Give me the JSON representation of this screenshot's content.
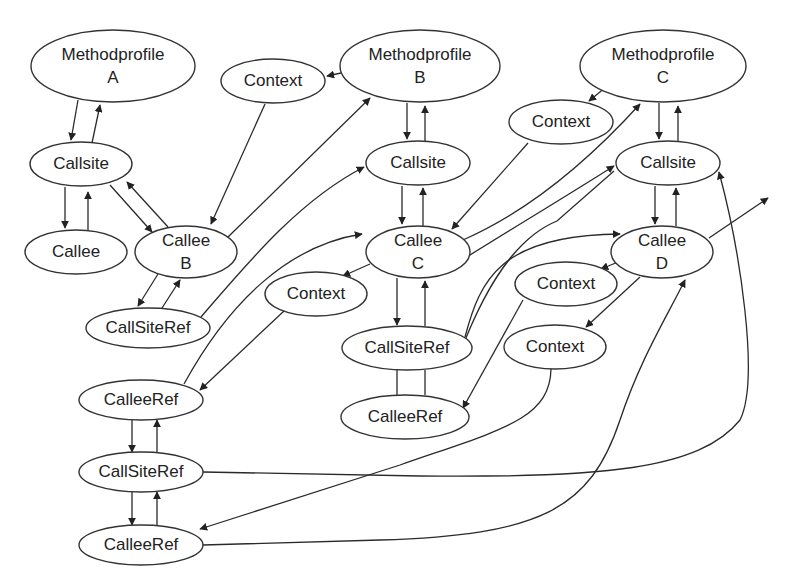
{
  "diagram": {
    "type": "graph",
    "colors": {
      "stroke": "#333333",
      "text": "#222222",
      "background": "#ffffff"
    },
    "nodes": [
      {
        "id": "mpA",
        "label": "Methodprofile",
        "sublabel": "A",
        "cx": 113,
        "cy": 66,
        "rx": 82,
        "ry": 36
      },
      {
        "id": "ctxTop",
        "label": "Context",
        "sublabel": "",
        "cx": 273,
        "cy": 81,
        "rx": 52,
        "ry": 22
      },
      {
        "id": "mpB",
        "label": "Methodprofile",
        "sublabel": "B",
        "cx": 420,
        "cy": 66,
        "rx": 80,
        "ry": 36
      },
      {
        "id": "mpC",
        "label": "Methodprofile",
        "sublabel": "C",
        "cx": 663,
        "cy": 66,
        "rx": 83,
        "ry": 36
      },
      {
        "id": "ctxC",
        "label": "Context",
        "sublabel": "",
        "cx": 561,
        "cy": 122,
        "rx": 52,
        "ry": 22
      },
      {
        "id": "csA",
        "label": "Callsite",
        "sublabel": "",
        "cx": 81,
        "cy": 164,
        "rx": 51,
        "ry": 22
      },
      {
        "id": "csB",
        "label": "Callsite",
        "sublabel": "",
        "cx": 418,
        "cy": 163,
        "rx": 52,
        "ry": 22
      },
      {
        "id": "csC",
        "label": "Callsite",
        "sublabel": "",
        "cx": 668,
        "cy": 163,
        "rx": 52,
        "ry": 22
      },
      {
        "id": "calleeA",
        "label": "Callee",
        "sublabel": "",
        "cx": 76,
        "cy": 252,
        "rx": 51,
        "ry": 22
      },
      {
        "id": "calleeB",
        "label": "Callee",
        "sublabel": "B",
        "cx": 186,
        "cy": 252,
        "rx": 51,
        "ry": 26
      },
      {
        "id": "calleeC",
        "label": "Callee",
        "sublabel": "C",
        "cx": 418,
        "cy": 252,
        "rx": 52,
        "ry": 26
      },
      {
        "id": "calleeD",
        "label": "Callee",
        "sublabel": "D",
        "cx": 662,
        "cy": 252,
        "rx": 51,
        "ry": 26
      },
      {
        "id": "ctxMid",
        "label": "Context",
        "sublabel": "",
        "cx": 316,
        "cy": 294,
        "rx": 51,
        "ry": 22
      },
      {
        "id": "ctxD1",
        "label": "Context",
        "sublabel": "",
        "cx": 566,
        "cy": 284,
        "rx": 51,
        "ry": 22
      },
      {
        "id": "ctxD2",
        "label": "Context",
        "sublabel": "",
        "cx": 555,
        "cy": 347,
        "rx": 51,
        "ry": 22
      },
      {
        "id": "csr1",
        "label": "CallSiteRef",
        "sublabel": "",
        "cx": 148,
        "cy": 328,
        "rx": 62,
        "ry": 20
      },
      {
        "id": "csrC",
        "label": "CallSiteRef",
        "sublabel": "",
        "cx": 407,
        "cy": 348,
        "rx": 65,
        "ry": 22
      },
      {
        "id": "cer1",
        "label": "CalleeRef",
        "sublabel": "",
        "cx": 141,
        "cy": 400,
        "rx": 62,
        "ry": 20
      },
      {
        "id": "cerC",
        "label": "CalleeRef",
        "sublabel": "",
        "cx": 405,
        "cy": 417,
        "rx": 64,
        "ry": 22
      },
      {
        "id": "csr2",
        "label": "CallSiteRef",
        "sublabel": "",
        "cx": 141,
        "cy": 472,
        "rx": 62,
        "ry": 20
      },
      {
        "id": "cer2",
        "label": "CalleeRef",
        "sublabel": "",
        "cx": 141,
        "cy": 545,
        "rx": 62,
        "ry": 20
      }
    ],
    "edges": [
      {
        "from": "mpA",
        "to": "csA",
        "d": "M78,100 L71,140",
        "arrow": true
      },
      {
        "from": "csA",
        "to": "mpA",
        "d": "M92,143 L100,105",
        "arrow": true
      },
      {
        "from": "mpB",
        "to": "ctxTop",
        "d": "M341,73 L327,76",
        "arrow": true
      },
      {
        "from": "ctxTop",
        "to": "calleeB",
        "d": "M265,104 L211,224",
        "arrow": true
      },
      {
        "from": "calleeB",
        "to": "mpB",
        "d": "M228,237 L370,98",
        "arrow": true
      },
      {
        "from": "mpB",
        "to": "csB",
        "d": "M407,103 L407,139",
        "arrow": true
      },
      {
        "from": "csB",
        "to": "mpB",
        "d": "M425,141 L425,106",
        "arrow": true
      },
      {
        "from": "csA",
        "to": "calleeA",
        "d": "M65,187 L65,228",
        "arrow": true
      },
      {
        "from": "calleeA",
        "to": "csA",
        "d": "M88,230 L88,192",
        "arrow": true
      },
      {
        "from": "csA",
        "to": "calleeB",
        "d": "M110,185 L152,232",
        "arrow": true
      },
      {
        "from": "calleeB",
        "to": "csA",
        "d": "M168,227 L127,182",
        "arrow": true
      },
      {
        "from": "csB",
        "to": "calleeC",
        "d": "M402,186 L402,224",
        "arrow": true
      },
      {
        "from": "calleeC",
        "to": "csB",
        "d": "M423,226 L423,188",
        "arrow": true
      },
      {
        "from": "mpC",
        "to": "ctxC",
        "d": "M606,87 L589,101",
        "arrow": true
      },
      {
        "from": "ctxC",
        "to": "calleeC",
        "d": "M528,143 L452,229",
        "arrow": true
      },
      {
        "from": "calleeC",
        "to": "mpC",
        "d": "M463,240 C520,215 580,170 640,104",
        "arrow": true
      },
      {
        "from": "mpC",
        "to": "csC",
        "d": "M659,103 L659,139",
        "arrow": true
      },
      {
        "from": "csC",
        "to": "mpC",
        "d": "M678,141 L678,106",
        "arrow": true
      },
      {
        "from": "csC",
        "to": "calleeD",
        "d": "M655,186 L655,224",
        "arrow": true
      },
      {
        "from": "calleeD",
        "to": "csC",
        "d": "M676,226 L676,188",
        "arrow": true
      },
      {
        "from": "calleeD",
        "to": "out",
        "d": "M709,238 L768,198",
        "arrow": true
      },
      {
        "from": "calleeB",
        "to": "csr1",
        "d": "M158,274 L138,306",
        "arrow": true
      },
      {
        "from": "csr1",
        "to": "calleeB",
        "d": "M162,308 L180,280",
        "arrow": true
      },
      {
        "from": "csr1",
        "to": "csB",
        "d": "M201,317 C250,260 300,200 364,167",
        "arrow": true
      },
      {
        "from": "cer1",
        "to": "calleeC",
        "d": "M184,384 C230,300 290,245 362,234",
        "arrow": true
      },
      {
        "from": "calleeC",
        "to": "ctxMid",
        "d": "M370,264 L343,276",
        "arrow": true
      },
      {
        "from": "ctxMid",
        "to": "cer1",
        "d": "M284,311 L200,390",
        "arrow": true
      },
      {
        "from": "calleeC",
        "to": "csrC",
        "d": "M397,278 L397,325",
        "arrow": true
      },
      {
        "from": "csrC",
        "to": "calleeC",
        "d": "M425,326 L425,281",
        "arrow": true
      },
      {
        "from": "csrC",
        "to": "cerC",
        "d": "M397,370 L397,395",
        "arrow": false
      },
      {
        "from": "cerC",
        "to": "csrC",
        "d": "M425,395 L425,370",
        "arrow": false
      },
      {
        "from": "csrC",
        "to": "calleeD",
        "d": "M465,337 C480,280 500,235 620,234",
        "arrow": true
      },
      {
        "from": "csrC",
        "to": "csC",
        "d": "M460,353 C480,300 510,240 557,221 L614,171",
        "arrow": false
      },
      {
        "from": "calleeC_csC",
        "to": "csC",
        "d": "M462,260 C510,230 560,200 614,166",
        "arrow": true
      },
      {
        "from": "calleeD",
        "to": "ctxD1",
        "d": "M618,262 L601,269",
        "arrow": true
      },
      {
        "from": "calleeD",
        "to": "ctxD2",
        "d": "M640,277 L586,327",
        "arrow": true
      },
      {
        "from": "ctxD1",
        "to": "cerC",
        "d": "M523,300 L463,408",
        "arrow": true
      },
      {
        "from": "cer1",
        "to": "csr2",
        "d": "M132,420 L132,452",
        "arrow": true
      },
      {
        "from": "csr2",
        "to": "cer1",
        "d": "M157,452 L157,420",
        "arrow": true
      },
      {
        "from": "csr2",
        "to": "cer2",
        "d": "M132,492 L132,525",
        "arrow": true
      },
      {
        "from": "cer2",
        "to": "csr2",
        "d": "M157,525 L157,492",
        "arrow": true
      },
      {
        "from": "ctxD2",
        "to": "cer2",
        "d": "M551,369 C550,420 500,430 400,465 L200,529",
        "arrow": true
      },
      {
        "from": "csr2",
        "to": "csC",
        "d": "M203,472 L420,476 C600,478 700,470 740,420 C760,380 740,250 719,172",
        "arrow": true
      },
      {
        "from": "cer2",
        "to": "calleeD",
        "d": "M203,545 L380,540 C540,535 590,510 620,420 C640,360 665,320 685,280",
        "arrow": true
      }
    ]
  }
}
